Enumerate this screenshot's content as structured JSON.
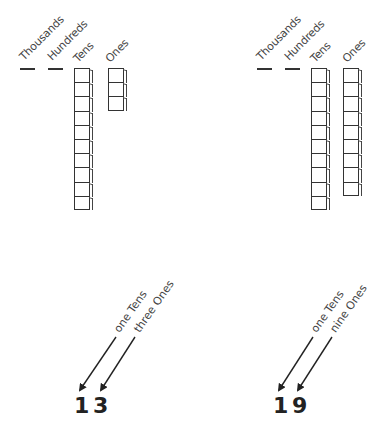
{
  "place_value_headers": [
    "Thousands",
    "Hundreds",
    "Tens",
    "Ones"
  ],
  "examples": [
    {
      "number": "13",
      "digits": [
        "1",
        "3"
      ],
      "tens_count": 1,
      "ones_count": 3,
      "arrow_labels": [
        "one Tens",
        "three Ones"
      ]
    },
    {
      "number": "19",
      "digits": [
        "1",
        "9"
      ],
      "tens_count": 1,
      "ones_count": 9,
      "arrow_labels": [
        "one Tens",
        "nine Ones"
      ]
    }
  ],
  "colors": {
    "line": "#333333",
    "text": "#444444",
    "background": "#ffffff"
  }
}
